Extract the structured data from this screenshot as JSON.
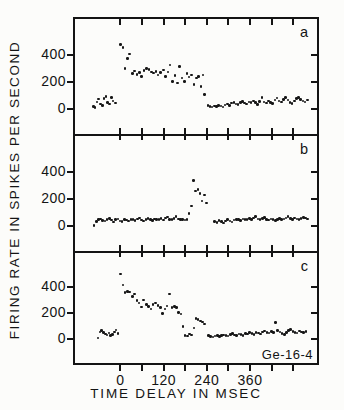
{
  "figure": {
    "y_axis_title": "FIRING RATE IN SPIKES PER SECOND",
    "x_axis_title": "TIME DELAY IN MSEC",
    "annotation": "Ge-16-4",
    "colors": {
      "ink": "#141414",
      "paper": "#fcfcfa"
    }
  },
  "chart_data": {
    "type": "scatter",
    "title": "",
    "xlabel": "TIME DELAY IN MSEC",
    "ylabel": "FIRING RATE IN SPIKES PER SECOND",
    "xlim": [
      -126,
      546
    ],
    "ylim": [
      -180,
      660
    ],
    "x_ticks": [
      0,
      60,
      120,
      180,
      240,
      300,
      360,
      420,
      480
    ],
    "x_tick_labels": [
      0,
      120,
      240,
      360
    ],
    "y_ticks": [
      0,
      200,
      400
    ],
    "legend": "none",
    "grid": false,
    "panels": [
      {
        "label": "a",
        "points": [
          [
            -75,
            20
          ],
          [
            -70,
            15
          ],
          [
            -65,
            55
          ],
          [
            -60,
            75
          ],
          [
            -55,
            40
          ],
          [
            -50,
            28
          ],
          [
            -45,
            80
          ],
          [
            -40,
            95
          ],
          [
            -35,
            50
          ],
          [
            -30,
            38
          ],
          [
            -25,
            88
          ],
          [
            -20,
            60
          ],
          [
            -14,
            45
          ],
          [
            0,
            475
          ],
          [
            7,
            450
          ],
          [
            13,
            300
          ],
          [
            20,
            370
          ],
          [
            26,
            405
          ],
          [
            33,
            260
          ],
          [
            40,
            280
          ],
          [
            46,
            255
          ],
          [
            53,
            270
          ],
          [
            59,
            240
          ],
          [
            66,
            285
          ],
          [
            73,
            300
          ],
          [
            79,
            290
          ],
          [
            86,
            272
          ],
          [
            92,
            265
          ],
          [
            99,
            278
          ],
          [
            105,
            252
          ],
          [
            112,
            268
          ],
          [
            119,
            288
          ],
          [
            125,
            238
          ],
          [
            132,
            272
          ],
          [
            138,
            325
          ],
          [
            145,
            205
          ],
          [
            152,
            248
          ],
          [
            158,
            192
          ],
          [
            165,
            312
          ],
          [
            171,
            228
          ],
          [
            178,
            202
          ],
          [
            185,
            260
          ],
          [
            191,
            235
          ],
          [
            198,
            252
          ],
          [
            204,
            180
          ],
          [
            211,
            230
          ],
          [
            217,
            240
          ],
          [
            224,
            165
          ],
          [
            230,
            250
          ],
          [
            234,
            110
          ],
          [
            243,
            30
          ],
          [
            249,
            22
          ],
          [
            255,
            18
          ],
          [
            261,
            25
          ],
          [
            267,
            20
          ],
          [
            273,
            28
          ],
          [
            279,
            24
          ],
          [
            285,
            18
          ],
          [
            291,
            32
          ],
          [
            297,
            40
          ],
          [
            303,
            28
          ],
          [
            309,
            45
          ],
          [
            315,
            52
          ],
          [
            321,
            38
          ],
          [
            327,
            35
          ],
          [
            333,
            48
          ],
          [
            339,
            58
          ],
          [
            345,
            45
          ],
          [
            351,
            38
          ],
          [
            357,
            55
          ],
          [
            363,
            50
          ],
          [
            369,
            62
          ],
          [
            375,
            48
          ],
          [
            381,
            35
          ],
          [
            387,
            58
          ],
          [
            393,
            88
          ],
          [
            399,
            55
          ],
          [
            405,
            45
          ],
          [
            411,
            62
          ],
          [
            417,
            52
          ],
          [
            423,
            42
          ],
          [
            429,
            68
          ],
          [
            435,
            82
          ],
          [
            441,
            60
          ],
          [
            447,
            55
          ],
          [
            453,
            72
          ],
          [
            459,
            88
          ],
          [
            465,
            68
          ],
          [
            471,
            48
          ],
          [
            477,
            42
          ],
          [
            483,
            62
          ],
          [
            489,
            78
          ],
          [
            495,
            85
          ],
          [
            501,
            72
          ],
          [
            507,
            60
          ],
          [
            513,
            55
          ],
          [
            519,
            68
          ]
        ]
      },
      {
        "label": "b",
        "points": [
          [
            -73,
            5
          ],
          [
            -67,
            35
          ],
          [
            -61,
            48
          ],
          [
            -55,
            55
          ],
          [
            -49,
            42
          ],
          [
            -43,
            38
          ],
          [
            -37,
            52
          ],
          [
            -31,
            58
          ],
          [
            -25,
            45
          ],
          [
            -19,
            32
          ],
          [
            -13,
            48
          ],
          [
            -7,
            55
          ],
          [
            -1,
            40
          ],
          [
            5,
            35
          ],
          [
            11,
            50
          ],
          [
            17,
            45
          ],
          [
            23,
            38
          ],
          [
            29,
            52
          ],
          [
            35,
            48
          ],
          [
            41,
            42
          ],
          [
            47,
            55
          ],
          [
            53,
            60
          ],
          [
            59,
            45
          ],
          [
            65,
            38
          ],
          [
            71,
            50
          ],
          [
            77,
            58
          ],
          [
            83,
            48
          ],
          [
            89,
            42
          ],
          [
            95,
            55
          ],
          [
            101,
            48
          ],
          [
            107,
            52
          ],
          [
            113,
            58
          ],
          [
            119,
            45
          ],
          [
            125,
            60
          ],
          [
            131,
            68
          ],
          [
            137,
            52
          ],
          [
            143,
            48
          ],
          [
            149,
            58
          ],
          [
            155,
            72
          ],
          [
            161,
            55
          ],
          [
            167,
            48
          ],
          [
            173,
            52
          ],
          [
            179,
            45
          ],
          [
            185,
            48
          ],
          [
            191,
            95
          ],
          [
            197,
            150
          ],
          [
            203,
            335
          ],
          [
            209,
            258
          ],
          [
            215,
            268
          ],
          [
            221,
            242
          ],
          [
            227,
            185
          ],
          [
            233,
            228
          ],
          [
            239,
            172
          ],
          [
            262,
            35
          ],
          [
            268,
            28
          ],
          [
            274,
            42
          ],
          [
            280,
            35
          ],
          [
            286,
            25
          ],
          [
            292,
            40
          ],
          [
            298,
            48
          ],
          [
            304,
            38
          ],
          [
            310,
            32
          ],
          [
            316,
            45
          ],
          [
            322,
            52
          ],
          [
            328,
            48
          ],
          [
            334,
            42
          ],
          [
            340,
            55
          ],
          [
            346,
            48
          ],
          [
            352,
            52
          ],
          [
            358,
            58
          ],
          [
            364,
            50
          ],
          [
            370,
            62
          ],
          [
            376,
            72
          ],
          [
            382,
            55
          ],
          [
            388,
            48
          ],
          [
            394,
            58
          ],
          [
            400,
            65
          ],
          [
            406,
            52
          ],
          [
            412,
            45
          ],
          [
            418,
            55
          ],
          [
            424,
            48
          ],
          [
            430,
            42
          ],
          [
            436,
            52
          ],
          [
            442,
            58
          ],
          [
            448,
            48
          ],
          [
            454,
            55
          ],
          [
            460,
            62
          ],
          [
            466,
            70
          ],
          [
            472,
            58
          ],
          [
            478,
            50
          ],
          [
            484,
            62
          ],
          [
            490,
            55
          ],
          [
            496,
            48
          ],
          [
            502,
            58
          ],
          [
            508,
            65
          ],
          [
            514,
            60
          ],
          [
            520,
            55
          ]
        ]
      },
      {
        "label": "c",
        "points": [
          [
            -62,
            12
          ],
          [
            -57,
            58
          ],
          [
            -52,
            68
          ],
          [
            -47,
            52
          ],
          [
            -42,
            42
          ],
          [
            -37,
            35
          ],
          [
            -32,
            48
          ],
          [
            -27,
            28
          ],
          [
            -22,
            38
          ],
          [
            -17,
            58
          ],
          [
            -12,
            72
          ],
          [
            -7,
            45
          ],
          [
            0,
            500
          ],
          [
            7,
            415
          ],
          [
            13,
            358
          ],
          [
            20,
            368
          ],
          [
            26,
            362
          ],
          [
            33,
            330
          ],
          [
            39,
            348
          ],
          [
            46,
            298
          ],
          [
            52,
            278
          ],
          [
            59,
            248
          ],
          [
            65,
            302
          ],
          [
            72,
            268
          ],
          [
            78,
            252
          ],
          [
            85,
            232
          ],
          [
            91,
            268
          ],
          [
            98,
            278
          ],
          [
            104,
            258
          ],
          [
            111,
            242
          ],
          [
            117,
            198
          ],
          [
            124,
            232
          ],
          [
            130,
            255
          ],
          [
            137,
            348
          ],
          [
            143,
            242
          ],
          [
            150,
            252
          ],
          [
            156,
            242
          ],
          [
            162,
            205
          ],
          [
            168,
            195
          ],
          [
            174,
            100
          ],
          [
            180,
            30
          ],
          [
            186,
            25
          ],
          [
            192,
            40
          ],
          [
            198,
            35
          ],
          [
            204,
            88
          ],
          [
            210,
            160
          ],
          [
            216,
            152
          ],
          [
            222,
            140
          ],
          [
            228,
            132
          ],
          [
            234,
            118
          ],
          [
            245,
            28
          ],
          [
            251,
            22
          ],
          [
            257,
            18
          ],
          [
            263,
            25
          ],
          [
            269,
            30
          ],
          [
            275,
            22
          ],
          [
            281,
            28
          ],
          [
            287,
            35
          ],
          [
            293,
            30
          ],
          [
            299,
            25
          ],
          [
            305,
            38
          ],
          [
            311,
            45
          ],
          [
            317,
            35
          ],
          [
            323,
            30
          ],
          [
            329,
            42
          ],
          [
            335,
            38
          ],
          [
            341,
            32
          ],
          [
            347,
            45
          ],
          [
            353,
            40
          ],
          [
            359,
            52
          ],
          [
            365,
            45
          ],
          [
            371,
            38
          ],
          [
            377,
            55
          ],
          [
            383,
            48
          ],
          [
            389,
            42
          ],
          [
            395,
            58
          ],
          [
            401,
            65
          ],
          [
            407,
            52
          ],
          [
            413,
            48
          ],
          [
            419,
            60
          ],
          [
            425,
            55
          ],
          [
            431,
            128
          ],
          [
            437,
            68
          ],
          [
            443,
            58
          ],
          [
            449,
            45
          ],
          [
            455,
            38
          ],
          [
            461,
            52
          ],
          [
            467,
            68
          ],
          [
            473,
            78
          ],
          [
            479,
            62
          ],
          [
            485,
            55
          ],
          [
            491,
            48
          ],
          [
            497,
            65
          ],
          [
            503,
            58
          ],
          [
            509,
            52
          ],
          [
            515,
            62
          ]
        ]
      }
    ]
  }
}
